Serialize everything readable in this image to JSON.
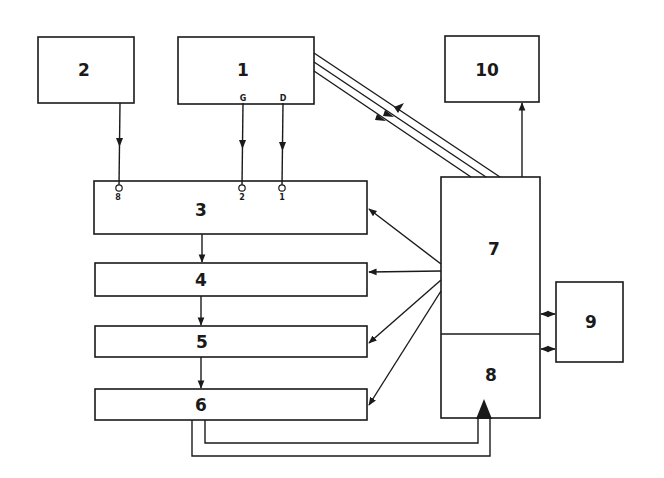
{
  "diagram": {
    "type": "block diagram",
    "colors": {
      "line": "#1a1a1a",
      "background": "#ffffff"
    },
    "blocks": [
      {
        "id": "1",
        "label": "1",
        "outputs": [
          "G",
          "D"
        ]
      },
      {
        "id": "2",
        "label": "2"
      },
      {
        "id": "3",
        "label": "3",
        "inputs": [
          "8",
          "2",
          "1"
        ]
      },
      {
        "id": "4",
        "label": "4"
      },
      {
        "id": "5",
        "label": "5"
      },
      {
        "id": "6",
        "label": "6"
      },
      {
        "id": "7",
        "label": "7"
      },
      {
        "id": "8",
        "label": "8"
      },
      {
        "id": "9",
        "label": "9"
      },
      {
        "id": "10",
        "label": "10"
      }
    ],
    "ports": {
      "block1_G": "G",
      "block1_D": "D",
      "block3_in8": "8",
      "block3_in2": "2",
      "block3_in1": "1"
    },
    "connections": [
      {
        "from": "2",
        "to": "3",
        "port": "8",
        "direction": "forward"
      },
      {
        "from": "1",
        "to": "3",
        "via": "G→2",
        "direction": "forward"
      },
      {
        "from": "1",
        "to": "3",
        "via": "D→1",
        "direction": "forward"
      },
      {
        "from": "3",
        "to": "4",
        "direction": "forward"
      },
      {
        "from": "4",
        "to": "5",
        "direction": "forward"
      },
      {
        "from": "5",
        "to": "6",
        "direction": "forward"
      },
      {
        "from": "7",
        "to": "3",
        "direction": "forward"
      },
      {
        "from": "7",
        "to": "4",
        "direction": "forward"
      },
      {
        "from": "7",
        "to": "5",
        "direction": "forward"
      },
      {
        "from": "7",
        "to": "6",
        "direction": "forward"
      },
      {
        "from": "7",
        "to": "10",
        "direction": "forward"
      },
      {
        "from": "7",
        "to": "1",
        "bus_lines": 3,
        "direction": "mixed"
      },
      {
        "from": "7",
        "to": "9",
        "direction": "bidirectional"
      },
      {
        "from": "8",
        "to": "9",
        "direction": "bidirectional"
      },
      {
        "from": "6",
        "to": "8",
        "lines": 2,
        "direction": "forward"
      }
    ]
  }
}
